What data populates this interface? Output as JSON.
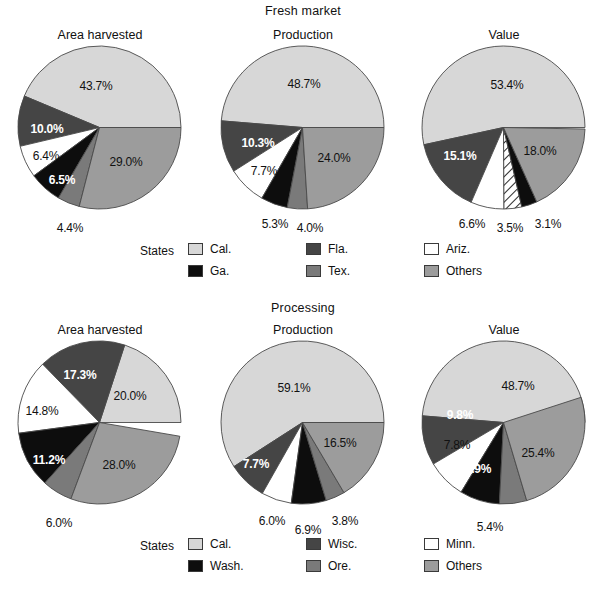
{
  "palette": {
    "cal": "#d7d7d7",
    "dark": "#454545",
    "white": "#ffffff",
    "black": "#0d0d0d",
    "mid": "#7a7a7a",
    "others": "#9c9c9c",
    "hatch": "#ffffff",
    "outline": "#4a4a4a",
    "text": "#111111",
    "label_light": "#ffffff"
  },
  "panels": [
    {
      "group_title": "Fresh market",
      "legend_label": "States",
      "legend": [
        [
          {
            "name": "Cal.",
            "color_key": "cal"
          },
          {
            "name": "Fla.",
            "color_key": "dark"
          },
          {
            "name": "Ariz.",
            "color_key": "white"
          }
        ],
        [
          {
            "name": "Ga.",
            "color_key": "black"
          },
          {
            "name": "Tex.",
            "color_key": "mid"
          },
          {
            "name": "Others",
            "color_key": "others"
          }
        ]
      ],
      "charts": [
        {
          "title": "Area harvested",
          "slices": [
            {
              "label": "Cal.",
              "value": 43.7,
              "text": "43.7%",
              "color_key": "cal",
              "label_style": "dark",
              "lx": 78,
              "ly": 40
            },
            {
              "label": "Fla.",
              "value": 10.0,
              "text": "10.0%",
              "color_key": "dark",
              "label_style": "light",
              "lx": 29,
              "ly": 83
            },
            {
              "label": "Ariz.",
              "value": 6.4,
              "text": "6.4%",
              "color_key": "white",
              "label_style": "dark",
              "lx": 28,
              "ly": 110
            },
            {
              "label": "Ga.",
              "value": 6.5,
              "text": "6.5%",
              "color_key": "black",
              "label_style": "light",
              "lx": 44,
              "ly": 134
            },
            {
              "label": "Tex.",
              "value": 4.4,
              "text": "4.4%",
              "color_key": "mid",
              "label_style": "outside",
              "lx": 52,
              "ly": 182
            },
            {
              "label": "Others",
              "value": 29.0,
              "text": "29.0%",
              "color_key": "others",
              "label_style": "dark",
              "lx": 108,
              "ly": 116
            }
          ]
        },
        {
          "title": "Production",
          "slices": [
            {
              "label": "Cal.",
              "value": 48.7,
              "text": "48.7%",
              "color_key": "cal",
              "label_style": "dark",
              "lx": 83,
              "ly": 38
            },
            {
              "label": "Fla.",
              "value": 10.3,
              "text": "10.3%",
              "color_key": "dark",
              "label_style": "light",
              "lx": 37,
              "ly": 97
            },
            {
              "label": "Ariz.",
              "value": 7.7,
              "text": "7.7%",
              "color_key": "white",
              "label_style": "dark",
              "lx": 43,
              "ly": 125
            },
            {
              "label": "Ga.",
              "value": 5.3,
              "text": "5.3%",
              "color_key": "black",
              "label_style": "outside",
              "lx": 54,
              "ly": 178
            },
            {
              "label": "Tex.",
              "value": 4.0,
              "text": "4.0%",
              "color_key": "mid",
              "label_style": "outside",
              "lx": 89,
              "ly": 182
            },
            {
              "label": "Others",
              "value": 24.0,
              "text": "24.0%",
              "color_key": "others",
              "label_style": "dark",
              "lx": 113,
              "ly": 112
            }
          ]
        },
        {
          "title": "Value",
          "slices": [
            {
              "label": "Cal.",
              "value": 53.4,
              "text": "53.4%",
              "color_key": "cal",
              "label_style": "dark",
              "lx": 85,
              "ly": 39
            },
            {
              "label": "Fla.",
              "value": 15.1,
              "text": "15.1%",
              "color_key": "dark",
              "label_style": "light",
              "lx": 38,
              "ly": 110
            },
            {
              "label": "Ariz.",
              "value": 6.6,
              "text": "6.6%",
              "color_key": "white",
              "label_style": "outside",
              "lx": 50,
              "ly": 178
            },
            {
              "label": "Tex.",
              "value": 3.5,
              "text": "3.5%",
              "color_key": "hatch",
              "label_style": "outside",
              "lx": 88,
              "ly": 182
            },
            {
              "label": "Ga.",
              "value": 3.1,
              "text": "3.1%",
              "color_key": "black",
              "label_style": "outside",
              "lx": 126,
              "ly": 178
            },
            {
              "label": "Others",
              "value": 18.0,
              "text": "18.0%",
              "color_key": "others",
              "label_style": "dark",
              "lx": 118,
              "ly": 105
            }
          ]
        }
      ]
    },
    {
      "group_title": "Processing",
      "legend_label": "States",
      "legend": [
        [
          {
            "name": "Cal.",
            "color_key": "cal"
          },
          {
            "name": "Wisc.",
            "color_key": "dark"
          },
          {
            "name": "Minn.",
            "color_key": "white"
          }
        ],
        [
          {
            "name": "Wash.",
            "color_key": "black"
          },
          {
            "name": "Ore.",
            "color_key": "mid"
          },
          {
            "name": "Others",
            "color_key": "others"
          }
        ]
      ],
      "charts": [
        {
          "title": "Area harvested",
          "slices": [
            {
              "label": "Cal.",
              "value": 20.0,
              "text": "20.0%",
              "color_key": "cal",
              "label_style": "dark",
              "lx": 112,
              "ly": 55
            },
            {
              "label": "Wisc.",
              "value": 17.3,
              "text": "17.3%",
              "color_key": "dark",
              "label_style": "light",
              "lx": 62,
              "ly": 34
            },
            {
              "label": "Minn.",
              "value": 14.8,
              "text": "14.8%",
              "color_key": "white",
              "label_style": "dark",
              "lx": 24,
              "ly": 70
            },
            {
              "label": "Wash.",
              "value": 11.2,
              "text": "11.2%",
              "color_key": "black",
              "label_style": "light",
              "lx": 31,
              "ly": 119
            },
            {
              "label": "Ore.",
              "value": 6.0,
              "text": "6.0%",
              "color_key": "mid",
              "label_style": "outside",
              "lx": 41,
              "ly": 182
            },
            {
              "label": "Others",
              "value": 28.0,
              "text": "28.0%",
              "color_key": "others",
              "label_style": "dark",
              "lx": 101,
              "ly": 124
            }
          ]
        },
        {
          "title": "Production",
          "slices": [
            {
              "label": "Cal.",
              "value": 59.1,
              "text": "59.1%",
              "color_key": "cal",
              "label_style": "dark",
              "lx": 73,
              "ly": 47
            },
            {
              "label": "Wisc.",
              "value": 7.7,
              "text": "7.7%",
              "color_key": "dark",
              "label_style": "light",
              "lx": 35,
              "ly": 123
            },
            {
              "label": "Minn.",
              "value": 6.0,
              "text": "6.0%",
              "color_key": "white",
              "label_style": "outside",
              "lx": 51,
              "ly": 180
            },
            {
              "label": "Wash.",
              "value": 6.9,
              "text": "6.9%",
              "color_key": "black",
              "label_style": "outside",
              "lx": 87,
              "ly": 189
            },
            {
              "label": "Ore.",
              "value": 3.8,
              "text": "3.8%",
              "color_key": "mid",
              "label_style": "outside",
              "lx": 124,
              "ly": 180
            },
            {
              "label": "Others",
              "value": 16.5,
              "text": "16.5%",
              "color_key": "others",
              "label_style": "dark",
              "lx": 119,
              "ly": 102
            }
          ]
        },
        {
          "title": "Value",
          "slices": [
            {
              "label": "Cal.",
              "value": 48.7,
              "text": "48.7%",
              "color_key": "cal",
              "label_style": "dark",
              "lx": 96,
              "ly": 45
            },
            {
              "label": "Wisc.",
              "value": 9.8,
              "text": "9.8%",
              "color_key": "dark",
              "label_style": "light",
              "lx": 38,
              "ly": 74
            },
            {
              "label": "Minn.",
              "value": 7.8,
              "text": "7.8%",
              "color_key": "white",
              "label_style": "dark",
              "lx": 35,
              "ly": 104
            },
            {
              "label": "Wash.",
              "value": 7.9,
              "text": "7.9%",
              "color_key": "black",
              "label_style": "light",
              "lx": 56,
              "ly": 128
            },
            {
              "label": "Ore.",
              "value": 5.4,
              "text": "5.4%",
              "color_key": "mid",
              "label_style": "outside",
              "lx": 68,
              "ly": 186
            },
            {
              "label": "Others",
              "value": 25.4,
              "text": "25.4%",
              "color_key": "others",
              "label_style": "dark",
              "lx": 116,
              "ly": 112
            }
          ]
        }
      ]
    }
  ],
  "chart_data": {
    "type": "pie",
    "panels": [
      {
        "name": "Fresh market",
        "legend_title": "States",
        "categories": [
          "Cal.",
          "Fla.",
          "Ariz.",
          "Ga.",
          "Tex.",
          "Others"
        ],
        "charts": [
          {
            "title": "Area harvested",
            "labels": [
              "Cal.",
              "Fla.",
              "Ariz.",
              "Ga.",
              "Tex.",
              "Others"
            ],
            "values": [
              43.7,
              10.0,
              6.4,
              6.5,
              4.4,
              29.0
            ],
            "unit": "%"
          },
          {
            "title": "Production",
            "labels": [
              "Cal.",
              "Fla.",
              "Ariz.",
              "Ga.",
              "Tex.",
              "Others"
            ],
            "values": [
              48.7,
              10.3,
              7.7,
              5.3,
              4.0,
              24.0
            ],
            "unit": "%"
          },
          {
            "title": "Value",
            "labels": [
              "Cal.",
              "Fla.",
              "Ariz.",
              "Tex.",
              "Ga.",
              "Others"
            ],
            "values": [
              53.4,
              15.1,
              6.6,
              3.5,
              3.1,
              18.0
            ],
            "unit": "%"
          }
        ]
      },
      {
        "name": "Processing",
        "legend_title": "States",
        "categories": [
          "Cal.",
          "Wisc.",
          "Minn.",
          "Wash.",
          "Ore.",
          "Others"
        ],
        "charts": [
          {
            "title": "Area harvested",
            "labels": [
              "Cal.",
              "Wisc.",
              "Minn.",
              "Wash.",
              "Ore.",
              "Others"
            ],
            "values": [
              20.0,
              17.3,
              14.8,
              11.2,
              6.0,
              28.0
            ],
            "unit": "%"
          },
          {
            "title": "Production",
            "labels": [
              "Cal.",
              "Wisc.",
              "Minn.",
              "Wash.",
              "Ore.",
              "Others"
            ],
            "values": [
              59.1,
              7.7,
              6.0,
              6.9,
              3.8,
              16.5
            ],
            "unit": "%"
          },
          {
            "title": "Value",
            "labels": [
              "Cal.",
              "Wisc.",
              "Minn.",
              "Wash.",
              "Ore.",
              "Others"
            ],
            "values": [
              48.7,
              9.8,
              7.8,
              7.9,
              5.4,
              25.4
            ],
            "unit": "%"
          }
        ]
      }
    ],
    "legend_position": "bottom",
    "start_angle_deg": 0,
    "direction": "counterclockwise",
    "grid": false
  }
}
